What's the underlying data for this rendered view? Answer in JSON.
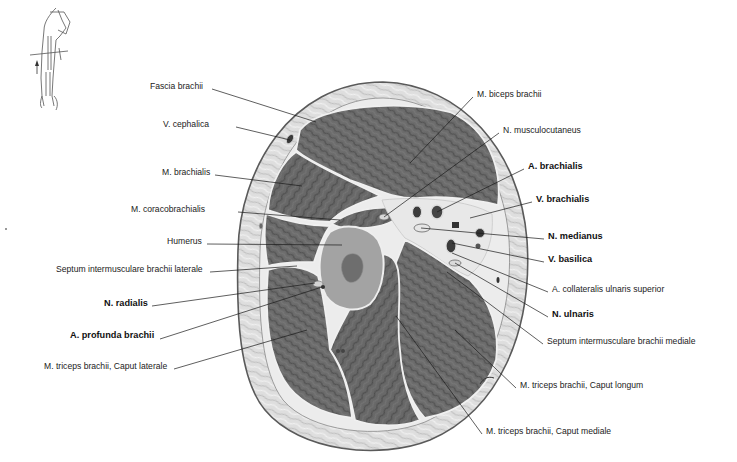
{
  "figure": {
    "type": "anatomical cross-section",
    "colors": {
      "background": "#ffffff",
      "skin_fat": "#dcdcdc",
      "fascia": "#f2f2f2",
      "muscle": "#6e6e6e",
      "muscle_dark": "#555555",
      "bone": "#9a9a9a",
      "leader_line": "#1a1a1a",
      "text": "#222222"
    }
  },
  "orientation_icon": {
    "name": "arm-section-orientation"
  },
  "labels_left": [
    {
      "text": "Fascia brachii",
      "bold": false,
      "x": 150,
      "y": 86,
      "tx": 316,
      "ty": 122,
      "lx": 212,
      "ly": 89
    },
    {
      "text": "V. cephalica",
      "bold": false,
      "x": 163,
      "y": 124,
      "tx": 290,
      "ty": 140,
      "lx": 236,
      "ly": 127
    },
    {
      "text": "M. brachialis",
      "bold": false,
      "x": 162,
      "y": 172,
      "tx": 302,
      "ty": 186,
      "lx": 215,
      "ly": 175
    },
    {
      "text": "M. coracobrachialis",
      "bold": false,
      "x": 131,
      "y": 209,
      "tx": 340,
      "ty": 220,
      "lx": 238,
      "ly": 212
    },
    {
      "text": "Humerus",
      "bold": false,
      "x": 167,
      "y": 241,
      "tx": 342,
      "ty": 245,
      "lx": 207,
      "ly": 244
    },
    {
      "text": "Septum intermusculare brachii laterale",
      "bold": false,
      "x": 56,
      "y": 269,
      "tx": 297,
      "ty": 266,
      "lx": 210,
      "ly": 272
    },
    {
      "text": "N. radialis",
      "bold": true,
      "x": 104,
      "y": 303,
      "tx": 315,
      "ty": 283,
      "lx": 152,
      "ly": 306
    },
    {
      "text": "A. profunda brachii",
      "bold": true,
      "x": 70,
      "y": 335,
      "tx": 322,
      "ty": 287,
      "lx": 160,
      "ly": 339
    },
    {
      "text": "M. triceps brachii, Caput laterale",
      "bold": false,
      "x": 44,
      "y": 366,
      "tx": 307,
      "ty": 330,
      "lx": 174,
      "ly": 369
    }
  ],
  "labels_right": [
    {
      "text": "M. biceps brachii",
      "bold": false,
      "x": 477,
      "y": 94,
      "tx": 410,
      "ty": 163,
      "lx": 473,
      "ly": 97
    },
    {
      "text": "N. musculocutaneus",
      "bold": false,
      "x": 503,
      "y": 130,
      "tx": 384,
      "ty": 217,
      "lx": 499,
      "ly": 133
    },
    {
      "text": "A. brachialis",
      "bold": true,
      "x": 528,
      "y": 166,
      "tx": 437,
      "ty": 212,
      "lx": 524,
      "ly": 169
    },
    {
      "text": "V. brachialis",
      "bold": true,
      "x": 536,
      "y": 199,
      "tx": 470,
      "ty": 218,
      "lx": 532,
      "ly": 202
    },
    {
      "text": "N. medianus",
      "bold": true,
      "x": 548,
      "y": 236,
      "tx": 421,
      "ty": 228,
      "lx": 544,
      "ly": 239
    },
    {
      "text": "V. basilica",
      "bold": true,
      "x": 548,
      "y": 259,
      "tx": 452,
      "ty": 243,
      "lx": 544,
      "ly": 262
    },
    {
      "text": "A. collateralis ulnaris superior",
      "bold": false,
      "x": 552,
      "y": 289,
      "tx": 452,
      "ty": 253,
      "lx": 548,
      "ly": 292
    },
    {
      "text": "N. ulnaris",
      "bold": true,
      "x": 552,
      "y": 314,
      "tx": 455,
      "ty": 263,
      "lx": 548,
      "ly": 317
    },
    {
      "text": "Septum intermusculare brachii mediale",
      "bold": false,
      "x": 547,
      "y": 341,
      "tx": 447,
      "ty": 272,
      "lx": 543,
      "ly": 344
    },
    {
      "text": "M. triceps brachii, Caput longum",
      "bold": false,
      "x": 520,
      "y": 385,
      "tx": 455,
      "ty": 330,
      "lx": 516,
      "ly": 388
    },
    {
      "text": "M. triceps brachii, Caput mediale",
      "bold": false,
      "x": 486,
      "y": 431,
      "tx": 396,
      "ty": 316,
      "lx": 482,
      "ly": 434
    }
  ]
}
